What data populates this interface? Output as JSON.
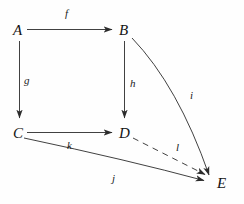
{
  "diagram": {
    "type": "commutative-diagram",
    "background_color": "#fefefe",
    "stroke_color": "#2b2b2b",
    "nodes": [
      {
        "id": "A",
        "label": "A",
        "x": 13,
        "y": 23
      },
      {
        "id": "B",
        "label": "B",
        "x": 119,
        "y": 23
      },
      {
        "id": "C",
        "label": "C",
        "x": 13,
        "y": 126
      },
      {
        "id": "D",
        "label": "D",
        "x": 119,
        "y": 126
      },
      {
        "id": "E",
        "label": "E",
        "x": 217,
        "y": 176
      }
    ],
    "edges": [
      {
        "id": "f",
        "label": "f",
        "from": "A",
        "to": "B",
        "style": "solid",
        "shape": "straight",
        "label_x": 65,
        "label_y": 8
      },
      {
        "id": "g",
        "label": "g",
        "from": "A",
        "to": "C",
        "style": "solid",
        "shape": "straight",
        "label_x": 24,
        "label_y": 75
      },
      {
        "id": "h",
        "label": "h",
        "from": "B",
        "to": "D",
        "style": "solid",
        "shape": "straight",
        "label_x": 130,
        "label_y": 78
      },
      {
        "id": "i",
        "label": "i",
        "from": "B",
        "to": "E",
        "style": "solid",
        "shape": "curved",
        "label_x": 190,
        "label_y": 90
      },
      {
        "id": "j",
        "label": "j",
        "from": "C",
        "to": "E",
        "style": "solid",
        "shape": "curved",
        "label_x": 112,
        "label_y": 173
      },
      {
        "id": "k",
        "label": "k",
        "from": "C",
        "to": "D",
        "style": "solid",
        "shape": "straight",
        "label_x": 67,
        "label_y": 140
      },
      {
        "id": "l",
        "label": "l",
        "from": "D",
        "to": "E",
        "style": "dashed",
        "shape": "straight",
        "label_x": 176,
        "label_y": 142
      }
    ]
  }
}
